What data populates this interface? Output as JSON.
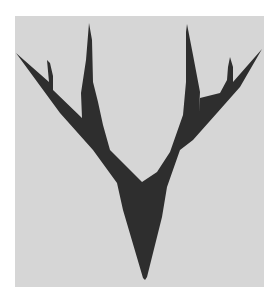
{
  "image": {
    "subject": "antler-tree-silhouette",
    "description": "Dark forked antler / tree silhouette on a light gray square",
    "colors": {
      "page_background": "#ffffff",
      "panel_background": "#d6d6d6",
      "silhouette": "#2e2e2e"
    }
  }
}
